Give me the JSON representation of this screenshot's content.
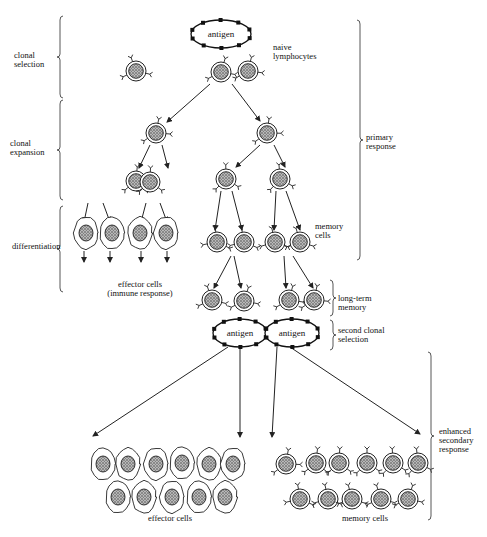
{
  "diagram": {
    "stages_left": [
      {
        "id": "clonal-selection",
        "text": "clonal\nselection",
        "x": 14,
        "y": 51
      },
      {
        "id": "clonal-expansion",
        "text": "clonal\nexpansion",
        "x": 10,
        "y": 139
      },
      {
        "id": "differentiation",
        "text": "differentiation",
        "x": 12,
        "y": 242
      }
    ],
    "stages_right": [
      {
        "id": "primary-response",
        "text": "primary\nresponse",
        "x": 366,
        "y": 133
      },
      {
        "id": "long-term-memory",
        "text": "long-term\nmemory",
        "x": 338,
        "y": 294
      },
      {
        "id": "second-clonal-selection",
        "text": "second clonal\nselection",
        "x": 338,
        "y": 326
      },
      {
        "id": "enhanced-secondary-response",
        "text": "enhanced\nsecondary\nresponse",
        "x": 439,
        "y": 427
      }
    ],
    "cell_labels": [
      {
        "id": "naive-lymphocytes",
        "text": "naive\nlymphocytes",
        "x": 273,
        "y": 43
      },
      {
        "id": "memory-cells-top",
        "text": "memory\ncells",
        "x": 315,
        "y": 222
      },
      {
        "id": "effector-cells-immune",
        "text": "effector cells\n(immune response)",
        "x": 90,
        "y": 280,
        "center": true,
        "w": 100
      },
      {
        "id": "effector-cells-bottom",
        "text": "effector cells",
        "x": 135,
        "y": 514,
        "center": true,
        "w": 70
      },
      {
        "id": "memory-cells-bottom",
        "text": "memory cells",
        "x": 330,
        "y": 514,
        "center": true,
        "w": 70
      }
    ],
    "antigens": [
      {
        "text": "antigen",
        "cx": 221,
        "cy": 34,
        "rx": 30,
        "ry": 14
      },
      {
        "text": "antigen",
        "cx": 240,
        "cy": 333,
        "rx": 27,
        "ry": 14
      },
      {
        "text": "antigen",
        "cx": 292,
        "cy": 333,
        "rx": 27,
        "ry": 14
      }
    ],
    "lymphocytes": [
      [
        136,
        71
      ],
      [
        221,
        72
      ],
      [
        248,
        71
      ],
      [
        156,
        133
      ],
      [
        267,
        133
      ],
      [
        136,
        181
      ],
      [
        150,
        182
      ],
      [
        226,
        179
      ],
      [
        280,
        179
      ],
      [
        217,
        242
      ],
      [
        244,
        242
      ],
      [
        275,
        242
      ],
      [
        300,
        242
      ],
      [
        212,
        300
      ],
      [
        244,
        301
      ],
      [
        289,
        300
      ],
      [
        314,
        300
      ],
      [
        286,
        464
      ],
      [
        316,
        463
      ],
      [
        339,
        463
      ],
      [
        367,
        463
      ],
      [
        393,
        463
      ],
      [
        418,
        463
      ],
      [
        300,
        499
      ],
      [
        328,
        499
      ],
      [
        352,
        499
      ],
      [
        381,
        499
      ],
      [
        408,
        499
      ]
    ],
    "effector_cells": [
      [
        86,
        233
      ],
      [
        112,
        233
      ],
      [
        140,
        233
      ],
      [
        166,
        233
      ],
      [
        103,
        464
      ],
      [
        128,
        464
      ],
      [
        156,
        464
      ],
      [
        182,
        463
      ],
      [
        209,
        464
      ],
      [
        233,
        464
      ],
      [
        118,
        497
      ],
      [
        144,
        497
      ],
      [
        172,
        497
      ],
      [
        199,
        497
      ],
      [
        225,
        497
      ]
    ],
    "arrows": [
      [
        [
          210,
          84
        ],
        [
          167,
          122
        ]
      ],
      [
        [
          232,
          84
        ],
        [
          260,
          121
        ]
      ],
      [
        [
          150,
          145
        ],
        [
          139,
          168
        ]
      ],
      [
        [
          162,
          145
        ],
        [
          168,
          168
        ]
      ],
      [
        [
          260,
          145
        ],
        [
          236,
          167
        ]
      ],
      [
        [
          274,
          145
        ],
        [
          285,
          167
        ]
      ],
      [
        [
          88,
          203
        ],
        [
          84,
          222
        ]
      ],
      [
        [
          103,
          203
        ],
        [
          110,
          222
        ]
      ],
      [
        [
          146,
          203
        ],
        [
          141,
          222
        ]
      ],
      [
        [
          160,
          203
        ],
        [
          167,
          222
        ]
      ],
      [
        [
          221,
          191
        ],
        [
          215,
          230
        ]
      ],
      [
        [
          232,
          191
        ],
        [
          242,
          230
        ]
      ],
      [
        [
          276,
          191
        ],
        [
          274,
          230
        ]
      ],
      [
        [
          286,
          191
        ],
        [
          300,
          230
        ]
      ],
      [
        [
          84,
          251
        ],
        [
          84,
          262
        ]
      ],
      [
        [
          110,
          251
        ],
        [
          110,
          262
        ]
      ],
      [
        [
          141,
          251
        ],
        [
          141,
          262
        ]
      ],
      [
        [
          167,
          251
        ],
        [
          167,
          262
        ]
      ],
      [
        [
          231,
          256
        ],
        [
          214,
          288
        ]
      ],
      [
        [
          234,
          256
        ],
        [
          241,
          288
        ]
      ],
      [
        [
          284,
          256
        ],
        [
          286,
          288
        ]
      ],
      [
        [
          293,
          256
        ],
        [
          313,
          288
        ]
      ],
      [
        [
          228,
          347
        ],
        [
          93,
          436
        ]
      ],
      [
        [
          240,
          347
        ],
        [
          240,
          437
        ]
      ],
      [
        [
          277,
          347
        ],
        [
          272,
          437
        ]
      ],
      [
        [
          290,
          347
        ],
        [
          420,
          434
        ]
      ]
    ],
    "braces": [
      {
        "x": 60,
        "y1": 16,
        "y2": 98,
        "side": "left"
      },
      {
        "x": 60,
        "y1": 100,
        "y2": 200,
        "side": "left"
      },
      {
        "x": 60,
        "y1": 206,
        "y2": 292,
        "side": "left"
      },
      {
        "x": 360,
        "y1": 20,
        "y2": 260,
        "side": "right"
      },
      {
        "x": 333,
        "y1": 280,
        "y2": 316,
        "side": "right"
      },
      {
        "x": 333,
        "y1": 320,
        "y2": 350,
        "side": "right"
      },
      {
        "x": 431,
        "y1": 352,
        "y2": 520,
        "side": "right"
      }
    ]
  }
}
